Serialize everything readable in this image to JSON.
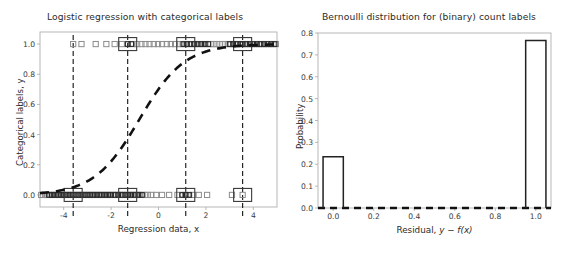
{
  "figure": {
    "width": 568,
    "height": 254,
    "background": "#ffffff",
    "frame_color": "#b0b0b0",
    "ink_color": "#1a1a1a",
    "marker_gray": "#8c8c8c"
  },
  "chart_data": [
    {
      "id": "logistic-regression",
      "type": "scatter",
      "title": "Logistic regression with categorical labels",
      "xlabel": "Regression data, x",
      "ylabel": "Categorical labels, y",
      "xlim": [
        -5.0,
        5.0
      ],
      "ylim": [
        -0.08,
        1.08
      ],
      "grid": false,
      "legend": null,
      "xticks": [
        -4,
        -2,
        0,
        2,
        4
      ],
      "xticklabels": [
        "-4",
        "-2",
        "0",
        "2",
        "4"
      ],
      "yticks": [
        0.0,
        0.2,
        0.4,
        0.6,
        0.8,
        1.0
      ],
      "yticklabels": [
        "0.0",
        "0.2",
        "0.4",
        "0.6",
        "0.8",
        "1.0"
      ],
      "series": [
        {
          "name": "observed labels (y = 0)",
          "marker": "square-open",
          "y": 0.0,
          "x": [
            -4.95,
            -4.86,
            -4.78,
            -4.7,
            -4.62,
            -4.55,
            -4.48,
            -4.4,
            -4.33,
            -4.26,
            -4.18,
            -4.1,
            -4.02,
            -3.95,
            -3.88,
            -3.8,
            -3.72,
            -3.65,
            -3.58,
            -3.5,
            -3.42,
            -3.35,
            -3.28,
            -3.2,
            -3.12,
            -3.05,
            -2.98,
            -2.9,
            -2.82,
            -2.75,
            -2.68,
            -2.6,
            -2.52,
            -2.45,
            -2.38,
            -2.3,
            -2.22,
            -2.15,
            -2.08,
            -2.0,
            -1.92,
            -1.85,
            -1.78,
            -1.7,
            -1.62,
            -1.55,
            -1.48,
            -1.4,
            -1.32,
            -1.25,
            -1.18,
            -1.1,
            -1.02,
            -0.95,
            -0.88,
            -0.8,
            -0.7,
            -0.58,
            -0.45,
            -0.3,
            -0.1,
            0.15,
            0.45,
            0.8,
            1.0,
            1.12,
            1.25,
            1.45,
            1.7,
            2.05,
            3.1,
            3.55
          ]
        },
        {
          "name": "observed labels (y = 1)",
          "marker": "square-open",
          "y": 1.0,
          "x": [
            -3.6,
            -3.25,
            -2.65,
            -2.2,
            -1.85,
            -1.55,
            -1.3,
            -1.1,
            -0.9,
            -0.72,
            -0.55,
            -0.38,
            -0.2,
            -0.02,
            0.15,
            0.35,
            0.52,
            0.7,
            0.88,
            1.02,
            1.15,
            1.28,
            1.42,
            1.55,
            1.68,
            1.82,
            1.95,
            2.08,
            2.2,
            2.32,
            2.45,
            2.58,
            2.7,
            2.82,
            2.95,
            3.05,
            3.15,
            3.25,
            3.35,
            3.45,
            3.55,
            3.65,
            3.75,
            3.85,
            3.95,
            4.05,
            4.15,
            4.25,
            4.35,
            4.45,
            4.55,
            4.65,
            4.75,
            4.85,
            4.95
          ]
        },
        {
          "name": "fitted logistic curve",
          "style": "dashed",
          "formula": "sigmoid(1.05 * x + 0.85)",
          "x": [
            -5.0,
            -4.0,
            -3.0,
            -2.0,
            -1.5,
            -1.0,
            -0.5,
            0.0,
            0.5,
            1.0,
            1.5,
            2.0,
            3.0,
            4.0,
            5.0
          ],
          "y": [
            0.013,
            0.035,
            0.096,
            0.237,
            0.33,
            0.45,
            0.579,
            0.7,
            0.799,
            0.871,
            0.92,
            0.951,
            0.983,
            0.994,
            0.998
          ]
        }
      ],
      "vlines": {
        "style": "dashed",
        "x": [
          -3.6,
          -1.3,
          1.15,
          3.55
        ]
      }
    },
    {
      "id": "bernoulli-residuals",
      "type": "bar",
      "title": "Bernoulli distribution for (binary) count labels",
      "xlabel": "Residual, y − f(x)",
      "ylabel": "Probability",
      "xlim": [
        -0.075,
        1.075
      ],
      "ylim": [
        0.0,
        0.8
      ],
      "grid": false,
      "legend": null,
      "xticks": [
        0.0,
        0.2,
        0.4,
        0.6,
        0.8,
        1.0
      ],
      "xticklabels": [
        "0.0",
        "0.2",
        "0.4",
        "0.6",
        "0.8",
        "1.0"
      ],
      "yticks": [
        0.0,
        0.1,
        0.2,
        0.3,
        0.4,
        0.5,
        0.6,
        0.7,
        0.8
      ],
      "yticklabels": [
        "0.0",
        "0.1",
        "0.2",
        "0.3",
        "0.4",
        "0.5",
        "0.6",
        "0.7",
        "0.8"
      ],
      "bar_style": "step-outline",
      "bar_width": 0.1,
      "categories": [
        "0.0",
        "1.0"
      ],
      "values": [
        0.234,
        0.766
      ],
      "baseline_style": "dashed"
    }
  ]
}
